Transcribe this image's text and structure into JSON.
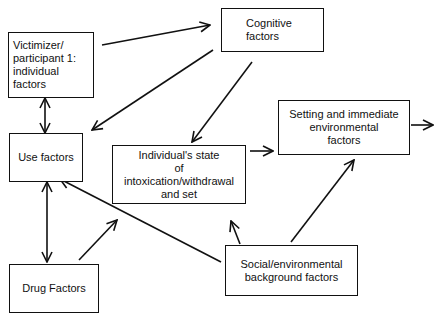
{
  "diagram": {
    "type": "flow",
    "nodes": [
      {
        "id": "victimizer",
        "label": "Victimizer/\nparticipant 1:\nindividual\nfactors"
      },
      {
        "id": "cognitive",
        "label": "Cognitive\nfactors"
      },
      {
        "id": "use",
        "label": "Use factors"
      },
      {
        "id": "state",
        "label": "Individual's state\nof\nintoxication/withdrawal\nand set"
      },
      {
        "id": "setting",
        "label": "Setting and immediate\nenvironmental\nfactors"
      },
      {
        "id": "social",
        "label": "Social/environmental\nbackground factors"
      },
      {
        "id": "drug",
        "label": "Drug Factors"
      }
    ],
    "edges": [
      {
        "from": "victimizer",
        "to": "cognitive",
        "direction": "forward"
      },
      {
        "from": "victimizer",
        "to": "use",
        "direction": "both"
      },
      {
        "from": "cognitive",
        "to": "use",
        "direction": "forward"
      },
      {
        "from": "cognitive",
        "to": "state",
        "direction": "forward"
      },
      {
        "from": "state",
        "to": "setting",
        "direction": "forward"
      },
      {
        "from": "setting",
        "to": "output",
        "direction": "forward"
      },
      {
        "from": "use",
        "to": "drug",
        "direction": "both"
      },
      {
        "from": "drug",
        "to": "state",
        "direction": "forward"
      },
      {
        "from": "social",
        "to": "use",
        "direction": "forward"
      },
      {
        "from": "social",
        "to": "state",
        "direction": "forward"
      },
      {
        "from": "social",
        "to": "setting",
        "direction": "forward"
      }
    ]
  }
}
